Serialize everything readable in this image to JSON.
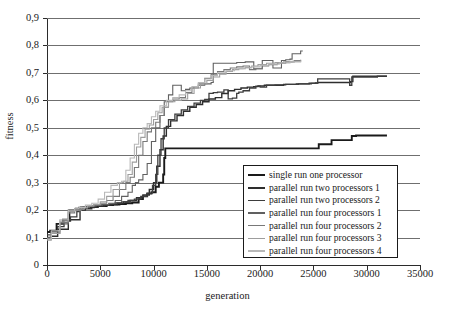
{
  "chart_data": {
    "type": "line",
    "title": "",
    "xlabel": "generation",
    "ylabel": "fitness",
    "xlim": [
      0,
      35000
    ],
    "ylim": [
      0,
      0.9
    ],
    "xticks": [
      0,
      5000,
      10000,
      15000,
      20000,
      25000,
      30000,
      35000
    ],
    "xtick_labels": [
      "0",
      "5000",
      "10000",
      "15000",
      "20000",
      "25000",
      "30000",
      "35000"
    ],
    "yticks": [
      0,
      0.1,
      0.2,
      0.3,
      0.4,
      0.5,
      0.6,
      0.7,
      0.8,
      0.9
    ],
    "ytick_labels": [
      "0",
      "0,1",
      "0,2",
      "0,3",
      "0,4",
      "0,5",
      "0,6",
      "0,7",
      "0,8",
      "0,9"
    ],
    "grid": "horizontal",
    "legend_position": "lower-right",
    "decimal_separator": ",",
    "series": [
      {
        "name": "single run one processor",
        "color": "#1a1a1a",
        "width": 1.9,
        "x": [
          0,
          300,
          900,
          1500,
          2100,
          2700,
          3200,
          3800,
          4400,
          5000,
          5600,
          6200,
          6800,
          7400,
          8000,
          8600,
          9000,
          9400,
          9800,
          10200,
          10500,
          10700,
          10900,
          11000,
          11100,
          25300,
          25500,
          26500,
          26700,
          28400,
          28600,
          29000,
          31900
        ],
        "y": [
          0.12,
          0.125,
          0.15,
          0.165,
          0.2,
          0.205,
          0.21,
          0.21,
          0.215,
          0.215,
          0.218,
          0.22,
          0.222,
          0.225,
          0.228,
          0.24,
          0.25,
          0.26,
          0.265,
          0.285,
          0.3,
          0.3,
          0.33,
          0.39,
          0.425,
          0.425,
          0.44,
          0.44,
          0.455,
          0.455,
          0.47,
          0.472,
          0.472
        ]
      },
      {
        "name": "parallel run two processors 1",
        "color": "#2e2e2e",
        "width": 1.4,
        "x": [
          0,
          400,
          1000,
          1800,
          2000,
          2200,
          2900,
          3100,
          3600,
          4200,
          4800,
          5400,
          6000,
          6600,
          7200,
          7800,
          8400,
          9000,
          9600,
          10000,
          10300,
          10600,
          10900,
          11200,
          11600,
          12200,
          12800,
          13400,
          14000,
          14600,
          15200,
          15800,
          16400,
          17000,
          17600,
          18200,
          18800,
          19400,
          19800,
          20400,
          21200,
          22200,
          23400,
          24600,
          25200,
          25400,
          26400,
          27600,
          28500,
          28700,
          29400,
          30600,
          31900
        ],
        "y": [
          0.1,
          0.105,
          0.13,
          0.13,
          0.16,
          0.165,
          0.165,
          0.2,
          0.205,
          0.21,
          0.215,
          0.218,
          0.22,
          0.225,
          0.23,
          0.235,
          0.245,
          0.255,
          0.275,
          0.3,
          0.36,
          0.42,
          0.47,
          0.505,
          0.525,
          0.545,
          0.56,
          0.575,
          0.585,
          0.595,
          0.605,
          0.61,
          0.625,
          0.635,
          0.64,
          0.645,
          0.648,
          0.65,
          0.652,
          0.655,
          0.655,
          0.658,
          0.66,
          0.662,
          0.663,
          0.665,
          0.665,
          0.665,
          0.668,
          0.688,
          0.688,
          0.688,
          0.688
        ]
      },
      {
        "name": "parallel run two processors 2",
        "color": "#3d3d3d",
        "width": 1.3,
        "x": [
          0,
          400,
          1000,
          1600,
          2200,
          2800,
          3000,
          3400,
          4000,
          4600,
          5200,
          5800,
          6400,
          7000,
          7600,
          8200,
          8800,
          9400,
          9900,
          10200,
          10400,
          10700,
          11000,
          11400,
          12000,
          12600,
          13200,
          13800,
          14400,
          14800,
          15200,
          15600,
          16000,
          16600,
          17000,
          17400,
          17800,
          18000,
          18400,
          19000,
          19600,
          20000,
          20600,
          21400,
          22400,
          23600,
          24800,
          25200,
          25400,
          26000,
          27200,
          28400,
          28600,
          29600,
          31000,
          31900
        ],
        "y": [
          0.11,
          0.115,
          0.14,
          0.165,
          0.175,
          0.195,
          0.21,
          0.212,
          0.215,
          0.218,
          0.22,
          0.222,
          0.226,
          0.23,
          0.235,
          0.24,
          0.25,
          0.262,
          0.29,
          0.33,
          0.4,
          0.46,
          0.5,
          0.53,
          0.55,
          0.565,
          0.578,
          0.59,
          0.6,
          0.603,
          0.625,
          0.628,
          0.63,
          0.638,
          0.605,
          0.608,
          0.625,
          0.63,
          0.635,
          0.645,
          0.652,
          0.648,
          0.655,
          0.656,
          0.658,
          0.66,
          0.662,
          0.663,
          0.678,
          0.678,
          0.678,
          0.655,
          0.685,
          0.685,
          0.688,
          0.688
        ]
      },
      {
        "name": "parallel run four processors 1",
        "color": "#606060",
        "width": 1.1,
        "x": [
          0,
          400,
          1200,
          2000,
          2800,
          3400,
          4000,
          4600,
          5200,
          5800,
          6400,
          7000,
          7600,
          8000,
          8300,
          8600,
          9000,
          9400,
          9800,
          10200,
          10600,
          11000,
          11400,
          11800,
          12200,
          12600,
          13000,
          13400,
          13800,
          14200,
          14800,
          15400,
          15600,
          16200,
          17000,
          17800,
          18600,
          19400,
          20000,
          20200,
          20600,
          21200,
          21600,
          22000,
          22400,
          22800,
          23000,
          23400,
          23800,
          24000
        ],
        "y": [
          0.1,
          0.115,
          0.15,
          0.2,
          0.205,
          0.21,
          0.215,
          0.218,
          0.22,
          0.225,
          0.235,
          0.25,
          0.265,
          0.29,
          0.3,
          0.31,
          0.33,
          0.37,
          0.45,
          0.5,
          0.545,
          0.595,
          0.62,
          0.655,
          0.655,
          0.635,
          0.64,
          0.645,
          0.65,
          0.655,
          0.66,
          0.665,
          0.735,
          0.735,
          0.735,
          0.738,
          0.74,
          0.715,
          0.715,
          0.745,
          0.745,
          0.718,
          0.718,
          0.745,
          0.748,
          0.75,
          0.77,
          0.77,
          0.78,
          0.78
        ]
      },
      {
        "name": "parallel run four processors 2",
        "color": "#787878",
        "width": 1.1,
        "x": [
          0,
          400,
          1200,
          2000,
          2600,
          3200,
          3800,
          4400,
          5000,
          5600,
          6200,
          6800,
          7400,
          7800,
          8200,
          8600,
          9000,
          9400,
          9800,
          10200,
          10600,
          11000,
          11400,
          11800,
          12400,
          13000,
          13600,
          14200,
          14800,
          15400,
          16000,
          16600,
          17200,
          17800,
          18400,
          19000,
          19600,
          20200,
          20800,
          21600,
          22400,
          23200,
          23800
        ],
        "y": [
          0.095,
          0.12,
          0.155,
          0.19,
          0.205,
          0.21,
          0.215,
          0.22,
          0.225,
          0.235,
          0.25,
          0.275,
          0.3,
          0.32,
          0.355,
          0.4,
          0.45,
          0.485,
          0.5,
          0.52,
          0.545,
          0.575,
          0.595,
          0.605,
          0.61,
          0.628,
          0.645,
          0.66,
          0.68,
          0.695,
          0.705,
          0.712,
          0.718,
          0.722,
          0.725,
          0.712,
          0.715,
          0.725,
          0.73,
          0.735,
          0.74,
          0.745,
          0.748
        ]
      },
      {
        "name": "parallel run four processors 3",
        "color": "#9d9d9d",
        "width": 1.1,
        "x": [
          0,
          400,
          1200,
          2000,
          2600,
          3200,
          3800,
          4400,
          5000,
          5600,
          6200,
          6800,
          7200,
          7600,
          8000,
          8400,
          8800,
          9200,
          9600,
          10000,
          10400,
          10800,
          11400,
          12000,
          12600,
          13200,
          13800,
          14400,
          15000,
          15600,
          16200,
          16800,
          17400,
          18000,
          18600,
          19200,
          19800,
          20600,
          21400,
          22200,
          23000,
          23800
        ],
        "y": [
          0.09,
          0.115,
          0.16,
          0.195,
          0.2,
          0.208,
          0.215,
          0.22,
          0.23,
          0.25,
          0.275,
          0.3,
          0.305,
          0.33,
          0.375,
          0.43,
          0.465,
          0.495,
          0.51,
          0.53,
          0.555,
          0.575,
          0.595,
          0.6,
          0.605,
          0.625,
          0.645,
          0.66,
          0.672,
          0.685,
          0.695,
          0.705,
          0.712,
          0.715,
          0.72,
          0.725,
          0.73,
          0.735,
          0.738,
          0.74,
          0.742,
          0.745
        ]
      },
      {
        "name": "parallel run four processors 4",
        "color": "#b8b8b8",
        "width": 1.1,
        "x": [
          0,
          400,
          1200,
          2000,
          2600,
          3000,
          3600,
          4200,
          4800,
          5400,
          6000,
          6600,
          7000,
          7400,
          7800,
          8200,
          8600,
          9000,
          9400,
          9800,
          10200,
          10600,
          11200,
          11800,
          12400,
          13000,
          13600,
          14200,
          14800,
          15400,
          16000,
          16800,
          17600,
          18400,
          19200,
          20000,
          20800,
          21800,
          22800,
          23800
        ],
        "y": [
          0.095,
          0.125,
          0.165,
          0.2,
          0.205,
          0.21,
          0.218,
          0.225,
          0.24,
          0.265,
          0.29,
          0.3,
          0.305,
          0.345,
          0.39,
          0.44,
          0.48,
          0.5,
          0.515,
          0.54,
          0.56,
          0.58,
          0.6,
          0.61,
          0.62,
          0.635,
          0.65,
          0.665,
          0.678,
          0.69,
          0.7,
          0.708,
          0.715,
          0.718,
          0.722,
          0.728,
          0.732,
          0.736,
          0.74,
          0.744
        ]
      }
    ]
  },
  "legend": {
    "items": [
      {
        "label": "single run one processor"
      },
      {
        "label": "parallel run two processors 1"
      },
      {
        "label": "parallel run two processors 2"
      },
      {
        "label": "parallel run four processors 1"
      },
      {
        "label": "parallel run four processors 2"
      },
      {
        "label": "parallel run four processors 3"
      },
      {
        "label": "parallel run four processors 4"
      }
    ]
  }
}
